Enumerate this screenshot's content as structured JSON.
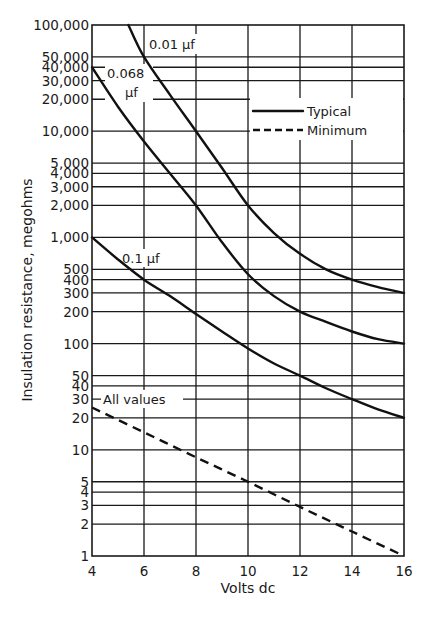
{
  "chart_data": {
    "type": "line",
    "title": "",
    "xlabel": "Volts dc",
    "ylabel": "Insulation resistance, megohms",
    "xscale": "linear",
    "yscale": "log",
    "xlim": [
      4,
      16
    ],
    "ylim": [
      1,
      100000
    ],
    "grid": true,
    "x_ticks": [
      4,
      6,
      8,
      10,
      12,
      14,
      16
    ],
    "x_tick_labels": [
      "4",
      "6",
      "8",
      "10",
      "12",
      "14",
      "16"
    ],
    "y_ticks": [
      1,
      2,
      3,
      4,
      5,
      10,
      20,
      30,
      40,
      50,
      100,
      200,
      300,
      400,
      500,
      1000,
      2000,
      3000,
      4000,
      5000,
      10000,
      20000,
      30000,
      40000,
      50000,
      100000
    ],
    "y_tick_labels": [
      "1",
      "2",
      "3",
      "4",
      "5",
      "10",
      "20",
      "30",
      "40",
      "50",
      "100",
      "200",
      "300",
      "400",
      "500",
      "1,000",
      "2,000",
      "3,000",
      "4,000",
      "5,000",
      "10,000",
      "20,000",
      "30,000",
      "40,000",
      "50,000",
      "100,000"
    ],
    "legend": {
      "position": "upper-right",
      "entries": [
        {
          "label": "Typical",
          "style": "solid"
        },
        {
          "label": "Minimum",
          "style": "dashed"
        }
      ]
    },
    "series": [
      {
        "name": "0.01 µf",
        "label_text": "0.01 µf",
        "style": "solid",
        "x": [
          5.4,
          6,
          7,
          8,
          9,
          10,
          11,
          12,
          13,
          14,
          15,
          16
        ],
        "y": [
          100000,
          50000,
          22000,
          10000,
          4500,
          2000,
          1100,
          700,
          500,
          400,
          340,
          300
        ]
      },
      {
        "name": "0.068 µf",
        "label_text": "0.068 µf",
        "style": "solid",
        "x": [
          4,
          5,
          6,
          7,
          8,
          9,
          10,
          11,
          12,
          13,
          14,
          15,
          16
        ],
        "y": [
          40000,
          17000,
          8000,
          4000,
          2000,
          900,
          450,
          280,
          200,
          160,
          130,
          110,
          100
        ]
      },
      {
        "name": "0.1 µf",
        "label_text": "0.1 µf",
        "style": "solid",
        "x": [
          4,
          5,
          6,
          7,
          8,
          9,
          10,
          11,
          12,
          13,
          14,
          15,
          16
        ],
        "y": [
          1000,
          620,
          400,
          280,
          190,
          130,
          90,
          65,
          50,
          38,
          30,
          24,
          20
        ]
      },
      {
        "name": "All values (Minimum)",
        "label_text": "All values",
        "style": "dashed",
        "x": [
          4,
          6,
          8,
          10,
          12,
          14,
          16
        ],
        "y": [
          25,
          14.6,
          8.5,
          5,
          2.9,
          1.7,
          1
        ]
      }
    ]
  }
}
